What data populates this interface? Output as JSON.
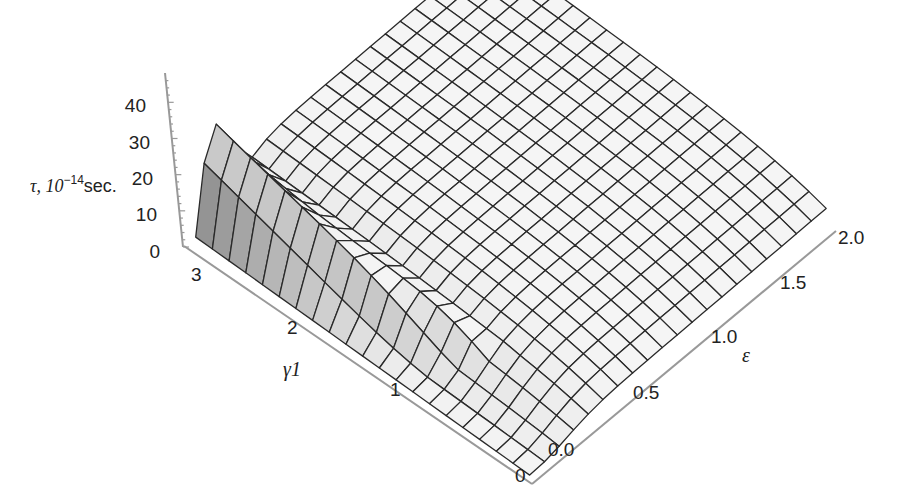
{
  "chart_data": {
    "type": "surface3d",
    "title": "",
    "zlabel": "τ, 10⁻¹⁴sec.",
    "zlabel_parts": {
      "symbol": "τ, 10",
      "exp": "−14",
      "unit": "sec."
    },
    "xlabel": "γ1",
    "ylabel": "ε",
    "x_ticks": [
      "0",
      "1",
      "2",
      "3"
    ],
    "y_ticks": [
      "0.0",
      "0.5",
      "1.0",
      "1.5",
      "2.0"
    ],
    "z_ticks": [
      "0",
      "10",
      "20",
      "30",
      "40"
    ],
    "x_range": [
      0,
      3.3
    ],
    "y_range": [
      0,
      2.0
    ],
    "z_range": [
      0,
      47
    ],
    "grid_lines": {
      "x": 20,
      "y": 20
    },
    "peak": {
      "x": 3.2,
      "y": 0.15,
      "z": 47
    },
    "plateau_level": 18,
    "shading": "grayscale",
    "mesh_color": "#2a2a2a"
  }
}
